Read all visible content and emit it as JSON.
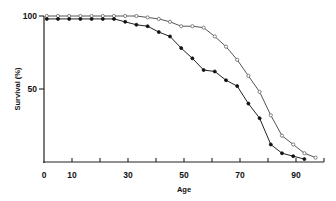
{
  "chart_data": {
    "type": "line",
    "title": "",
    "xlabel": "Age",
    "ylabel": "Survival (%)",
    "xlim": [
      0,
      100
    ],
    "ylim": [
      0,
      100
    ],
    "grid": false,
    "legend": null,
    "x_ticks": [
      0,
      10,
      20,
      30,
      40,
      50,
      60,
      70,
      80,
      90,
      100
    ],
    "x_tick_labels": [
      "0",
      "10",
      "",
      "30",
      "",
      "50",
      "",
      "70",
      "",
      "90",
      ""
    ],
    "y_ticks": [
      50,
      100
    ],
    "y_tick_labels": [
      "50",
      "100"
    ],
    "series": [
      {
        "name": "open-circles",
        "marker": "open-circle",
        "x": [
          1,
          5,
          9,
          13,
          17,
          21,
          25,
          29,
          33,
          37,
          41,
          45,
          49,
          53,
          57,
          61,
          65,
          69,
          73,
          77,
          81,
          85,
          89,
          93,
          97
        ],
        "values": [
          100,
          100,
          100,
          100,
          100,
          100,
          100,
          100,
          100,
          99,
          98,
          96,
          93,
          93,
          92,
          86,
          79,
          70,
          59,
          48,
          32,
          18,
          12,
          6,
          3
        ]
      },
      {
        "name": "filled-circles",
        "marker": "filled-circle",
        "x": [
          1,
          5,
          9,
          13,
          17,
          21,
          25,
          29,
          33,
          37,
          41,
          45,
          49,
          53,
          57,
          61,
          65,
          69,
          73,
          77,
          81,
          85,
          89,
          93
        ],
        "values": [
          98,
          98,
          98,
          98,
          98,
          98,
          98,
          96,
          94,
          93,
          89,
          86,
          78,
          71,
          63,
          62,
          56,
          52,
          40,
          30,
          12,
          6,
          4,
          2
        ]
      }
    ]
  },
  "labels": {
    "xlabel": "Age",
    "ylabel": "Survival (%)"
  }
}
